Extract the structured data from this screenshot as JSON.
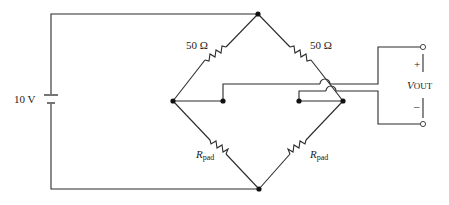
{
  "diagram": {
    "type": "wheatstone-bridge-circuit",
    "source": {
      "label": "10 V"
    },
    "resistors": {
      "top_left": {
        "label": "50 Ω"
      },
      "top_right": {
        "label": "50 Ω"
      },
      "bottom_left": {
        "label_main": "R",
        "label_sub": "pad"
      },
      "bottom_right": {
        "label_main": "R",
        "label_sub": "pad"
      }
    },
    "output": {
      "plus": "+",
      "minus": "–",
      "label_main": "V",
      "label_sub": "OUT"
    }
  }
}
